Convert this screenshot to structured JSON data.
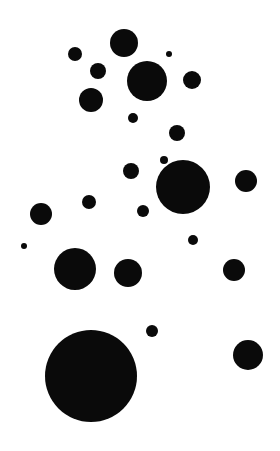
{
  "canvas": {
    "width": 280,
    "height": 451,
    "background": "#ffffff",
    "fill": "#0a0a0a"
  },
  "dots": [
    {
      "x": 124,
      "y": 43,
      "r": 14
    },
    {
      "x": 75,
      "y": 54,
      "r": 7
    },
    {
      "x": 169,
      "y": 54,
      "r": 3
    },
    {
      "x": 98,
      "y": 71,
      "r": 8
    },
    {
      "x": 147,
      "y": 81,
      "r": 20
    },
    {
      "x": 192,
      "y": 80,
      "r": 9
    },
    {
      "x": 91,
      "y": 100,
      "r": 12
    },
    {
      "x": 133,
      "y": 118,
      "r": 5
    },
    {
      "x": 177,
      "y": 133,
      "r": 8
    },
    {
      "x": 131,
      "y": 171,
      "r": 8
    },
    {
      "x": 164,
      "y": 160,
      "r": 4
    },
    {
      "x": 183,
      "y": 187,
      "r": 27
    },
    {
      "x": 246,
      "y": 181,
      "r": 11
    },
    {
      "x": 89,
      "y": 202,
      "r": 7
    },
    {
      "x": 41,
      "y": 214,
      "r": 11
    },
    {
      "x": 143,
      "y": 211,
      "r": 6
    },
    {
      "x": 24,
      "y": 246,
      "r": 3
    },
    {
      "x": 193,
      "y": 240,
      "r": 5
    },
    {
      "x": 75,
      "y": 269,
      "r": 21
    },
    {
      "x": 128,
      "y": 273,
      "r": 14
    },
    {
      "x": 234,
      "y": 270,
      "r": 11
    },
    {
      "x": 152,
      "y": 331,
      "r": 6
    },
    {
      "x": 248,
      "y": 355,
      "r": 15
    },
    {
      "x": 91,
      "y": 376,
      "r": 46
    }
  ]
}
